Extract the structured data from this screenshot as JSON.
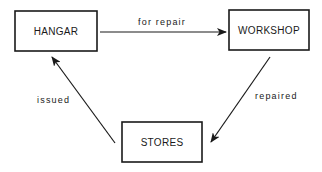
{
  "diagram": {
    "nodes": [
      {
        "id": "hangar",
        "label": "HANGAR"
      },
      {
        "id": "workshop",
        "label": "WORKSHOP"
      },
      {
        "id": "stores",
        "label": "STORES"
      }
    ],
    "edges": [
      {
        "from": "hangar",
        "to": "workshop",
        "label": "for repair"
      },
      {
        "from": "workshop",
        "to": "stores",
        "label": "repaired"
      },
      {
        "from": "stores",
        "to": "hangar",
        "label": "issued"
      }
    ],
    "colors": {
      "stroke": "#1a1a1a",
      "background": "#ffffff"
    }
  }
}
